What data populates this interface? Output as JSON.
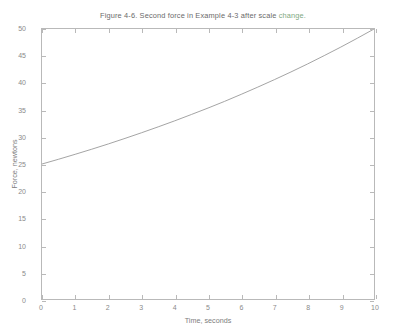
{
  "chart_data": {
    "type": "line",
    "title": "Figure 4-6. Second force in Example 4-3 after scale change.",
    "title_parts": {
      "main": "Figure 4-6. Second force in Example 4-3 after scale ",
      "accent": "change.",
      "accent_color": "#7fa87f"
    },
    "xlabel": "Time, seconds",
    "ylabel": "Force, newtons",
    "xlim": [
      0,
      10
    ],
    "ylim": [
      0,
      50
    ],
    "xticks": [
      0,
      1,
      2,
      3,
      4,
      5,
      6,
      7,
      8,
      9,
      10
    ],
    "yticks": [
      0,
      5,
      10,
      15,
      20,
      25,
      30,
      35,
      40,
      45,
      50
    ],
    "grid": false,
    "legend": null,
    "line_color": "#9a9a9a",
    "series": [
      {
        "name": "Second force",
        "x": [
          0,
          0.5,
          1,
          1.5,
          2,
          2.5,
          3,
          3.5,
          4,
          4.5,
          5,
          5.5,
          6,
          6.5,
          7,
          7.5,
          8,
          8.5,
          9,
          9.5,
          10
        ],
        "values": [
          25.0,
          25.88,
          26.8,
          27.74,
          28.72,
          29.74,
          30.79,
          31.88,
          33.0,
          34.17,
          35.36,
          36.6,
          37.9,
          39.24,
          40.62,
          42.05,
          43.53,
          45.07,
          46.65,
          48.3,
          50.0
        ]
      }
    ]
  }
}
